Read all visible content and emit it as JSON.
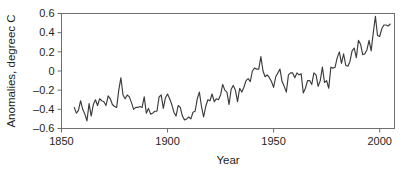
{
  "chart_data": {
    "type": "line",
    "title": "",
    "xlabel": "Year",
    "ylabel": "Anomalies, degreec C",
    "xlim": [
      1850,
      2007
    ],
    "ylim": [
      -0.6,
      0.6
    ],
    "grid": false,
    "legend": null,
    "line_color": "#3b3b3b",
    "frame_color": "#6f6f6f",
    "xticks": [
      1850,
      1900,
      1950,
      2000
    ],
    "xtick_labels": [
      "1850",
      "1900",
      "1950",
      "2000"
    ],
    "yticks": [
      -0.6,
      -0.4,
      -0.2,
      0,
      0.2,
      0.4,
      0.6
    ],
    "ytick_labels": [
      "-0.6",
      "-0.4",
      "-0.2",
      "0",
      "0.2",
      "0.4",
      "0.6"
    ],
    "series": [
      {
        "name": "Global temperature anomaly",
        "x": [
          1856,
          1857,
          1858,
          1859,
          1860,
          1861,
          1862,
          1863,
          1864,
          1865,
          1866,
          1867,
          1868,
          1869,
          1870,
          1871,
          1872,
          1873,
          1874,
          1875,
          1876,
          1877,
          1878,
          1879,
          1880,
          1881,
          1882,
          1883,
          1884,
          1885,
          1886,
          1887,
          1888,
          1889,
          1890,
          1891,
          1892,
          1893,
          1894,
          1895,
          1896,
          1897,
          1898,
          1899,
          1900,
          1901,
          1902,
          1903,
          1904,
          1905,
          1906,
          1907,
          1908,
          1909,
          1910,
          1911,
          1912,
          1913,
          1914,
          1915,
          1916,
          1917,
          1918,
          1919,
          1920,
          1921,
          1922,
          1923,
          1924,
          1925,
          1926,
          1927,
          1928,
          1929,
          1930,
          1931,
          1932,
          1933,
          1934,
          1935,
          1936,
          1937,
          1938,
          1939,
          1940,
          1941,
          1942,
          1943,
          1944,
          1945,
          1946,
          1947,
          1948,
          1949,
          1950,
          1951,
          1952,
          1953,
          1954,
          1955,
          1956,
          1957,
          1958,
          1959,
          1960,
          1961,
          1962,
          1963,
          1964,
          1965,
          1966,
          1967,
          1968,
          1969,
          1970,
          1971,
          1972,
          1973,
          1974,
          1975,
          1976,
          1977,
          1978,
          1979,
          1980,
          1981,
          1982,
          1983,
          1984,
          1985,
          1986,
          1987,
          1988,
          1989,
          1990,
          1991,
          1992,
          1993,
          1994,
          1995,
          1996,
          1997,
          1998,
          1999,
          2000,
          2001,
          2002,
          2003,
          2004,
          2005
        ],
        "values": [
          -0.38,
          -0.44,
          -0.41,
          -0.31,
          -0.4,
          -0.45,
          -0.52,
          -0.34,
          -0.47,
          -0.35,
          -0.3,
          -0.36,
          -0.29,
          -0.31,
          -0.32,
          -0.36,
          -0.26,
          -0.29,
          -0.35,
          -0.37,
          -0.38,
          -0.2,
          -0.07,
          -0.25,
          -0.29,
          -0.25,
          -0.27,
          -0.33,
          -0.4,
          -0.38,
          -0.38,
          -0.37,
          -0.38,
          -0.27,
          -0.44,
          -0.39,
          -0.45,
          -0.44,
          -0.42,
          -0.42,
          -0.27,
          -0.25,
          -0.39,
          -0.28,
          -0.24,
          -0.29,
          -0.35,
          -0.43,
          -0.47,
          -0.36,
          -0.38,
          -0.47,
          -0.51,
          -0.5,
          -0.48,
          -0.5,
          -0.43,
          -0.42,
          -0.29,
          -0.22,
          -0.37,
          -0.48,
          -0.37,
          -0.3,
          -0.31,
          -0.24,
          -0.32,
          -0.29,
          -0.3,
          -0.25,
          -0.14,
          -0.2,
          -0.22,
          -0.35,
          -0.19,
          -0.15,
          -0.2,
          -0.32,
          -0.18,
          -0.22,
          -0.17,
          -0.1,
          -0.08,
          -0.11,
          0.0,
          0.03,
          0.02,
          0.02,
          0.15,
          0.0,
          -0.06,
          -0.04,
          -0.07,
          -0.11,
          -0.17,
          -0.06,
          -0.02,
          0.02,
          -0.11,
          -0.16,
          -0.22,
          -0.04,
          -0.02,
          -0.02,
          -0.07,
          -0.02,
          -0.04,
          -0.03,
          -0.23,
          -0.18,
          -0.1,
          -0.1,
          -0.14,
          -0.02,
          -0.04,
          -0.16,
          -0.1,
          0.04,
          -0.12,
          -0.1,
          -0.18,
          0.04,
          0.03,
          0.04,
          0.14,
          0.2,
          0.08,
          0.18,
          0.06,
          0.05,
          0.1,
          0.21,
          0.24,
          0.14,
          0.32,
          0.28,
          0.17,
          0.18,
          0.22,
          0.32,
          0.21,
          0.4,
          0.57,
          0.37,
          0.36,
          0.44,
          0.48,
          0.48,
          0.47,
          0.49
        ]
      }
    ]
  },
  "axes": {
    "xlabel": "Year",
    "ylabel": "Anomalies, degreec C"
  }
}
